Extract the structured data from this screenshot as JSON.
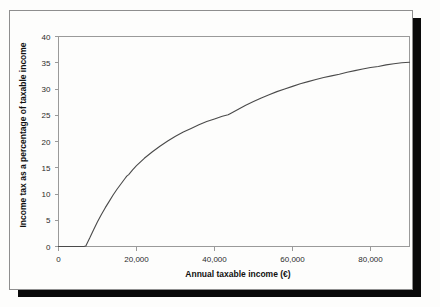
{
  "figure": {
    "background_color": "#fdfdfc",
    "frame_color": "#8e8e8e",
    "shadow_color": "#0a0a0a",
    "line_color": "#4a4a4a"
  },
  "chart_data": {
    "type": "line",
    "title": "",
    "subtitle": "",
    "xlabel": "Annual taxable income (€)",
    "ylabel": "Income tax as a percentage of taxable income",
    "xlim": [
      0,
      90000
    ],
    "ylim": [
      0,
      40
    ],
    "xticks": [
      0,
      20000,
      40000,
      60000,
      80000
    ],
    "xtick_labels": [
      "0",
      "20,000",
      "40,000",
      "60,000",
      "80,000"
    ],
    "yticks": [
      0,
      5,
      10,
      15,
      20,
      25,
      30,
      35,
      40
    ],
    "ytick_labels": [
      "0",
      "5",
      "10",
      "15",
      "20",
      "25",
      "30",
      "35",
      "40"
    ],
    "grid": false,
    "legend": false,
    "legend_position": "none",
    "series": [
      {
        "name": "Income tax as a percentage of taxable income",
        "x": [
          0,
          3000,
          5000,
          6500,
          7000,
          8000,
          9000,
          10000,
          11000,
          12000,
          13000,
          14000,
          15000,
          16000,
          17000,
          17500,
          18000,
          19000,
          20000,
          22000,
          24000,
          26000,
          28000,
          30000,
          32000,
          34000,
          36000,
          38000,
          40000,
          42000,
          43500,
          44000,
          46000,
          48000,
          50000,
          52000,
          54000,
          56000,
          58000,
          60000,
          62000,
          64000,
          66000,
          68000,
          70000,
          72000,
          74000,
          76000,
          78000,
          80000,
          82000,
          84000,
          86000,
          88000,
          90000
        ],
        "y": [
          0,
          0,
          0,
          0,
          0.1,
          1.6,
          3.2,
          4.7,
          6.1,
          7.4,
          8.6,
          9.8,
          10.9,
          11.9,
          12.9,
          13.4,
          13.7,
          14.6,
          15.4,
          16.8,
          18.0,
          19.1,
          20.1,
          21.0,
          21.8,
          22.5,
          23.2,
          23.8,
          24.3,
          24.8,
          25.1,
          25.3,
          26.1,
          26.9,
          27.6,
          28.3,
          28.9,
          29.5,
          30.0,
          30.5,
          31.0,
          31.4,
          31.8,
          32.2,
          32.5,
          32.8,
          33.2,
          33.5,
          33.8,
          34.1,
          34.3,
          34.6,
          34.8,
          35.0,
          35.1
        ]
      }
    ]
  }
}
